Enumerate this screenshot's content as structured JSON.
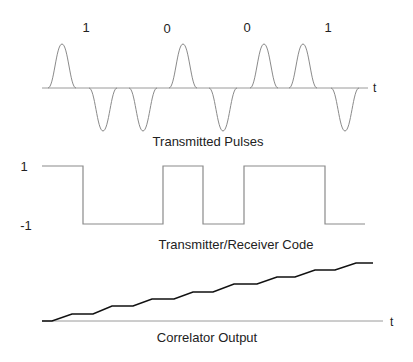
{
  "bit_labels": [
    "1",
    "0",
    "0",
    "1"
  ],
  "axis_t_label": "t",
  "pulses": {
    "caption": "Transmitted Pulses",
    "baseline_y": 88,
    "x_start": 42,
    "x_end": 368,
    "polarities": [
      1,
      -1,
      -1,
      1,
      -1,
      1,
      1,
      -1
    ],
    "centers_x": [
      62,
      103,
      143,
      183,
      223,
      264,
      303,
      345
    ]
  },
  "code": {
    "caption": "Transmitter/Receiver Code",
    "high_label": "1",
    "low_label": "-1",
    "levels": [
      1,
      -1,
      -1,
      1,
      -1,
      -1,
      1,
      1,
      -1
    ]
  },
  "correlator": {
    "caption": "Correlator Output",
    "steps": 8
  },
  "colors": {
    "line": "#9a9a9a",
    "curve": "#111111",
    "text": "#222222"
  }
}
